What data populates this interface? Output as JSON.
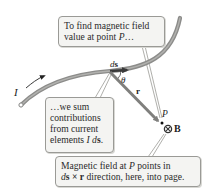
{
  "diagram": {
    "callouts": {
      "top": {
        "line1": "To find magnetic field",
        "line2_prefix": "value at point ",
        "line2_var": "P",
        "line2_suffix": "…"
      },
      "left": {
        "line1": "…we sum",
        "line2": "contributions",
        "line3": "from current",
        "line4_prefix": "elements ",
        "line4_var_I": "I",
        "line4_var_d": "d",
        "line4_var_s": "s",
        "line4_suffix": "."
      },
      "bottom": {
        "line1_prefix": "Magnetic field at ",
        "line1_var": "P",
        "line1_suffix": " points in",
        "line2_d": "d",
        "line2_s": "s",
        "line2_cross": " × ",
        "line2_r": "r",
        "line2_suffix": " direction, here, into page."
      }
    },
    "labels": {
      "current": "I",
      "ds_d": "d",
      "ds_s": "s",
      "theta": "θ",
      "r": "r",
      "point": "P",
      "field": "B"
    },
    "colors": {
      "wire": "#8c8c8a",
      "wire_highlight": "#c9c9c6",
      "vector": "#7f7f7d",
      "callout_bg": "#f4f4f2",
      "callout_border": "#9a9a96",
      "text": "#2a2a2a"
    }
  }
}
